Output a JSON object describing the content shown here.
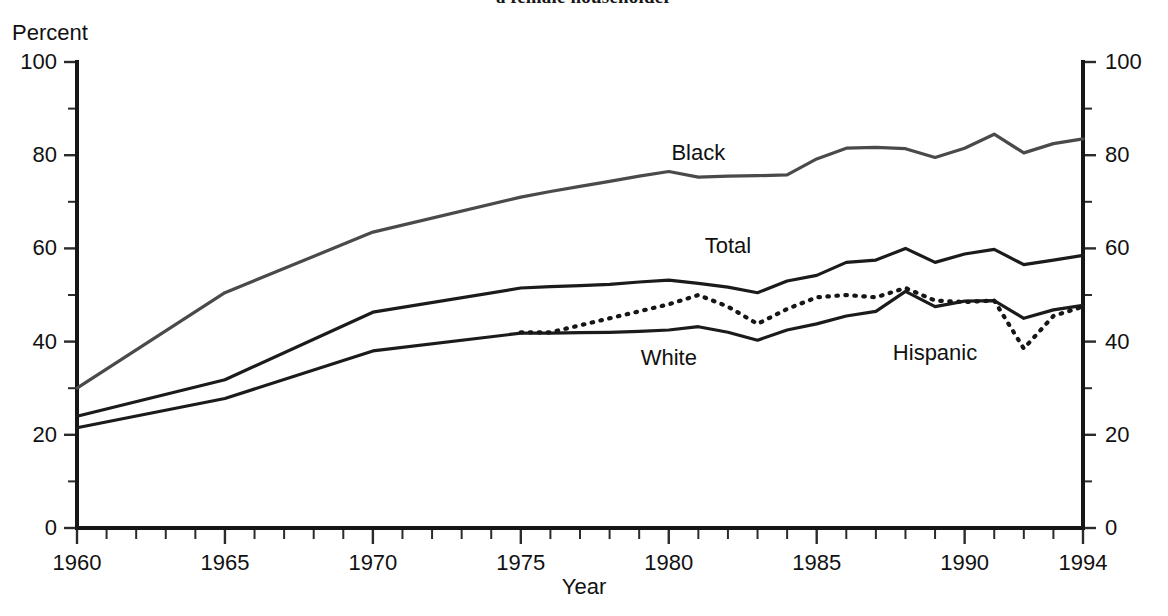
{
  "chart_data": {
    "type": "line",
    "title": "a female householder",
    "xlabel": "Year",
    "ylabel": "Percent",
    "xlim": [
      1960,
      1994
    ],
    "ylim": [
      0,
      100
    ],
    "grid": false,
    "legend_position": "inline-labels",
    "x_ticks": [
      1960,
      1965,
      1970,
      1975,
      1980,
      1985,
      1990,
      1994
    ],
    "x_tick_labels": [
      "1960",
      "1965",
      "1970",
      "1975",
      "1980",
      "1985",
      "1990",
      "1994"
    ],
    "x_minor_tick_step": 1,
    "y_ticks": [
      0,
      20,
      40,
      60,
      80,
      100
    ],
    "y_tick_labels": [
      "0",
      "20",
      "40",
      "60",
      "80",
      "100"
    ],
    "y_minor_tick_step": 10,
    "right_axis_ticks": [
      0,
      20,
      40,
      60,
      80,
      100
    ],
    "right_axis_tick_labels": [
      "0",
      "20",
      "40",
      "60",
      "80",
      "100"
    ],
    "series": [
      {
        "name": "Black",
        "style": "solid",
        "color": "#4a4a4a",
        "label_x": 1981,
        "label_y": 80.5,
        "x": [
          1960,
          1965,
          1970,
          1975,
          1976,
          1977,
          1978,
          1979,
          1980,
          1981,
          1982,
          1983,
          1984,
          1985,
          1986,
          1987,
          1988,
          1989,
          1990,
          1991,
          1992,
          1993,
          1994
        ],
        "values": [
          30.0,
          50.5,
          63.5,
          71.0,
          72.2,
          73.3,
          74.4,
          75.5,
          76.5,
          75.3,
          75.5,
          75.6,
          75.8,
          79.2,
          81.5,
          81.7,
          81.4,
          79.5,
          81.5,
          84.5,
          80.5,
          82.5,
          83.5
        ]
      },
      {
        "name": "Total",
        "style": "solid",
        "color": "#1b1b1b",
        "label_x": 1982,
        "label_y": 60.5,
        "x": [
          1960,
          1965,
          1970,
          1975,
          1976,
          1977,
          1978,
          1979,
          1980,
          1981,
          1982,
          1983,
          1984,
          1985,
          1986,
          1987,
          1988,
          1989,
          1990,
          1991,
          1992,
          1993,
          1994
        ],
        "values": [
          24.0,
          31.8,
          46.3,
          51.5,
          51.8,
          52.0,
          52.3,
          52.8,
          53.2,
          52.5,
          51.7,
          50.5,
          53.0,
          54.2,
          57.0,
          57.5,
          60.0,
          57.0,
          58.8,
          59.8,
          56.5,
          57.5,
          58.5
        ]
      },
      {
        "name": "White",
        "style": "solid",
        "color": "#1b1b1b",
        "label_x": 1980,
        "label_y": 36.5,
        "x": [
          1960,
          1965,
          1970,
          1975,
          1976,
          1977,
          1978,
          1979,
          1980,
          1981,
          1982,
          1983,
          1984,
          1985,
          1986,
          1987,
          1988,
          1989,
          1990,
          1991,
          1992,
          1993,
          1994
        ],
        "values": [
          21.5,
          27.8,
          38.0,
          41.8,
          41.8,
          41.9,
          42.0,
          42.2,
          42.5,
          43.2,
          42.0,
          40.3,
          42.5,
          43.8,
          45.5,
          46.5,
          50.8,
          47.5,
          48.7,
          48.8,
          45.0,
          46.8,
          47.8
        ]
      },
      {
        "name": "Hispanic",
        "style": "dotted",
        "color": "#161616",
        "label_x": 1989,
        "label_y": 37.5,
        "x": [
          1975,
          1976,
          1977,
          1978,
          1979,
          1980,
          1981,
          1982,
          1983,
          1984,
          1985,
          1986,
          1987,
          1988,
          1989,
          1990,
          1991,
          1992,
          1993,
          1994
        ],
        "values": [
          42.0,
          42.0,
          43.5,
          45.0,
          46.5,
          48.0,
          50.0,
          47.5,
          43.8,
          47.0,
          49.5,
          50.0,
          49.5,
          51.5,
          48.8,
          48.5,
          48.8,
          38.5,
          45.5,
          47.5
        ]
      }
    ]
  }
}
